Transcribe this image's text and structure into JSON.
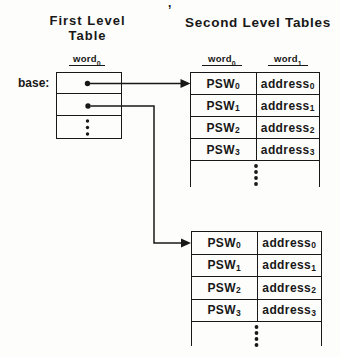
{
  "colors": {
    "ink": "#181818",
    "bg": "#fdfdfb"
  },
  "stray_mark": ",",
  "first_level": {
    "title_line1": "First Level",
    "title_line2": "Table",
    "base_label": "base:",
    "column_header": {
      "text": "word",
      "sub": "0"
    }
  },
  "second_level": {
    "title": "Second Level Tables",
    "column_headers": [
      {
        "text": "word",
        "sub": "0"
      },
      {
        "text": "word",
        "sub": "1"
      }
    ],
    "tables": [
      {
        "rows": [
          {
            "psw": "PSW",
            "psw_sub": "0",
            "address": "address",
            "address_sub": "0"
          },
          {
            "psw": "PSW",
            "psw_sub": "1",
            "address": "address",
            "address_sub": "1"
          },
          {
            "psw": "PSW",
            "psw_sub": "2",
            "address": "address",
            "address_sub": "2"
          },
          {
            "psw": "PSW",
            "psw_sub": "3",
            "address": "address",
            "address_sub": "3"
          }
        ]
      },
      {
        "rows": [
          {
            "psw": "PSW",
            "psw_sub": "0",
            "address": "address",
            "address_sub": "0"
          },
          {
            "psw": "PSW",
            "psw_sub": "1",
            "address": "address",
            "address_sub": "1"
          },
          {
            "psw": "PSW",
            "psw_sub": "2",
            "address": "address",
            "address_sub": "2"
          },
          {
            "psw": "PSW",
            "psw_sub": "3",
            "address": "address",
            "address_sub": "3"
          }
        ]
      }
    ]
  }
}
